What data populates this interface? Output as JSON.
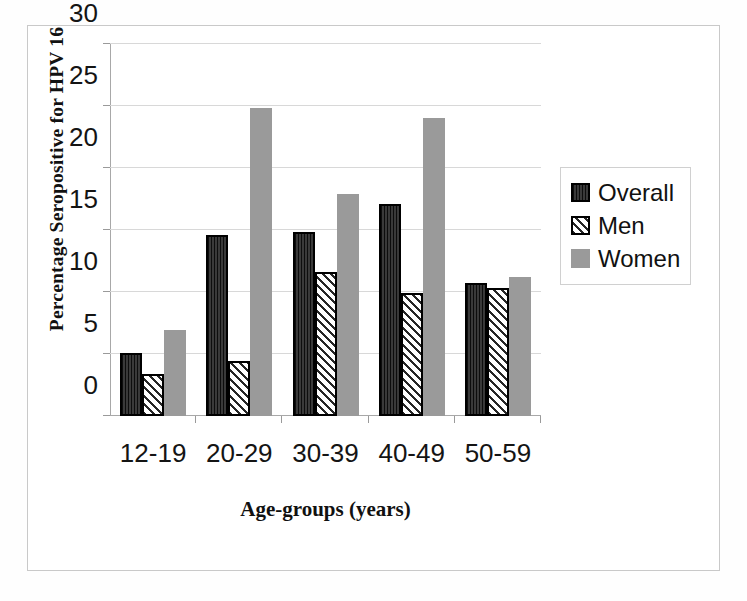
{
  "chart_data": {
    "type": "bar",
    "title": "",
    "xlabel": "Age-groups (years)",
    "ylabel": "Percentage Seropositive for HPV 16",
    "categories": [
      "12-19",
      "20-29",
      "30-39",
      "40-49",
      "50-59"
    ],
    "series": [
      {
        "name": "Overall",
        "values": [
          5.1,
          14.6,
          14.8,
          17.1,
          10.7
        ],
        "color": "#2e2e2e",
        "pattern": "vertical-lines"
      },
      {
        "name": "Men",
        "values": [
          3.4,
          4.4,
          11.6,
          9.9,
          10.3
        ],
        "color": "#ffffff",
        "pattern": "diagonal-hatch"
      },
      {
        "name": "Women",
        "values": [
          6.9,
          24.8,
          17.9,
          24.0,
          11.2
        ],
        "color": "#9a9a9a",
        "pattern": "solid"
      }
    ],
    "ylim": [
      0,
      30
    ],
    "yticks": [
      0,
      5,
      10,
      15,
      20,
      25,
      30
    ],
    "ytick_labels": [
      "0",
      "5",
      "10",
      "15",
      "20",
      "25",
      "30"
    ],
    "grid": true,
    "legend_position": "right",
    "legend_entries": [
      "Overall",
      "Men",
      "Women"
    ]
  }
}
